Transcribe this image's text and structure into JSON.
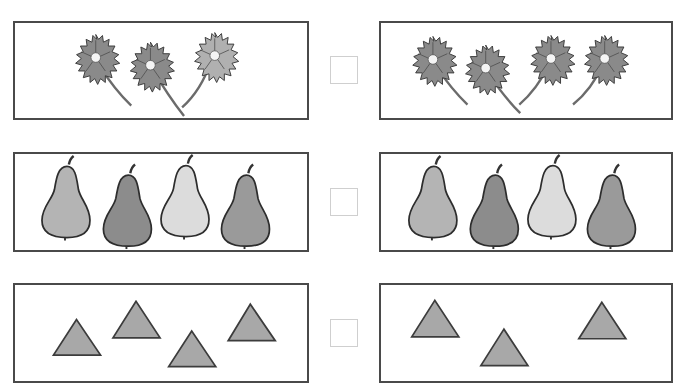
{
  "colors": {
    "panel_border": "#4a4a4a",
    "checkbox_border": "#cfcfcf",
    "flower_dark": "#8a8a8a",
    "flower_light": "#b0b0b0",
    "flower_center": "#f4f4f4",
    "stem": "#6b6b6b",
    "triangle_fill": "#a8a8a8",
    "triangle_stroke": "#3c3c3c"
  },
  "rows": [
    {
      "name": "flowers",
      "left": {
        "item": "flower",
        "count": 3
      },
      "right": {
        "item": "flower",
        "count": 4
      },
      "checkbox": {
        "checked": false
      }
    },
    {
      "name": "pears",
      "left": {
        "item": "pear",
        "count": 4,
        "shades": [
          "#b4b4b4",
          "#8c8c8c",
          "#dcdcdc",
          "#9a9a9a"
        ]
      },
      "right": {
        "item": "pear",
        "count": 4,
        "shades": [
          "#b4b4b4",
          "#8c8c8c",
          "#dcdcdc",
          "#9a9a9a"
        ]
      },
      "checkbox": {
        "checked": false
      }
    },
    {
      "name": "triangles",
      "left": {
        "item": "triangle",
        "count": 4
      },
      "right": {
        "item": "triangle",
        "count": 3
      },
      "checkbox": {
        "checked": false
      }
    }
  ]
}
